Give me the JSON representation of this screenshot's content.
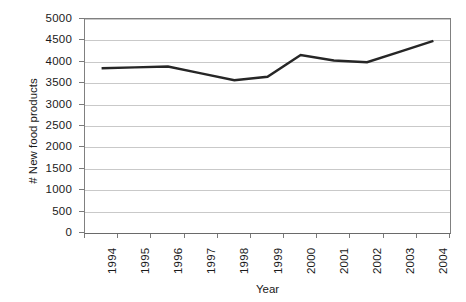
{
  "chart_data": {
    "type": "line",
    "title": "",
    "xlabel": "Year",
    "ylabel": "# New food products",
    "categories": [
      "1994",
      "1995",
      "1996",
      "1997",
      "1998",
      "1999",
      "2000",
      "2001",
      "2002",
      "2003",
      "2004"
    ],
    "values": [
      3850,
      3870,
      3890,
      3730,
      3570,
      3650,
      4160,
      4030,
      3990,
      4240,
      4490
    ],
    "series": [
      {
        "name": "# New food products",
        "values": [
          3850,
          3870,
          3890,
          3730,
          3570,
          3650,
          4160,
          4030,
          3990,
          4240,
          4490
        ]
      }
    ],
    "ylim": [
      0,
      5000
    ],
    "yticks": [
      0,
      500,
      1000,
      1500,
      2000,
      2500,
      3000,
      3500,
      4000,
      4500,
      5000
    ],
    "ytick_labels": [
      "0",
      "500",
      "1000",
      "1500",
      "2000",
      "2500",
      "3000",
      "3500",
      "4000",
      "4500",
      "5000"
    ],
    "grid": "horizontal",
    "legend": "none",
    "line_color": "#262626",
    "grid_color": "#c9c9c9",
    "axis_color": "#808080",
    "background_color": "#ffffff",
    "text_color": "#1a1a1a"
  }
}
